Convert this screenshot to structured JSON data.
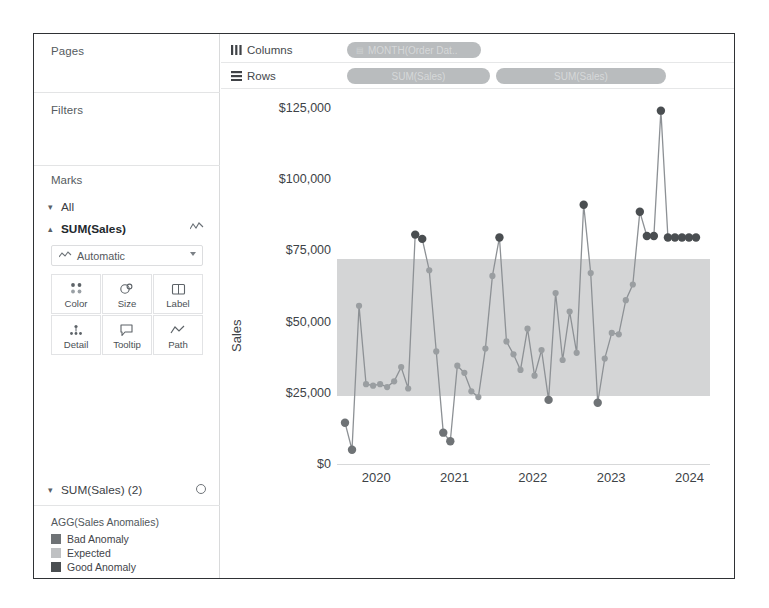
{
  "window": {
    "title": "Tableau Worksheet"
  },
  "sidebar": {
    "pages": {
      "label": "Pages"
    },
    "filters": {
      "label": "Filters"
    },
    "marks": {
      "label": "Marks",
      "all_label": "All",
      "sum_sales_label": "SUM(Sales)",
      "mark_type": "Automatic",
      "buttons": [
        {
          "label": "Color",
          "icon": "color-icon"
        },
        {
          "label": "Size",
          "icon": "size-icon"
        },
        {
          "label": "Label",
          "icon": "label-icon"
        },
        {
          "label": "Detail",
          "icon": "detail-icon"
        },
        {
          "label": "Tooltip",
          "icon": "tooltip-icon"
        },
        {
          "label": "Path",
          "icon": "path-icon"
        }
      ],
      "sum_sales_2_label": "SUM(Sales) (2)"
    },
    "legend": {
      "title": "AGG(Sales Anomalies)",
      "items": [
        {
          "label": "Bad Anomaly",
          "color": "#6f7376"
        },
        {
          "label": "Expected",
          "color": "#bfc1c3"
        },
        {
          "label": "Good Anomaly",
          "color": "#4a4e51"
        }
      ]
    }
  },
  "shelves": {
    "columns_label": "Columns",
    "rows_label": "Rows",
    "columns_pills": [
      {
        "text": "MONTH(Order Dat.."
      }
    ],
    "rows_pills": [
      {
        "text": "SUM(Sales)"
      },
      {
        "text": "SUM(Sales)"
      }
    ]
  },
  "chart_data": {
    "type": "line",
    "title": "",
    "xlabel": "",
    "ylabel": "Sales",
    "ylim": [
      0,
      131250
    ],
    "yticks": [
      0,
      25000,
      50000,
      75000,
      100000,
      125000
    ],
    "ytick_labels": [
      "$0",
      "$25,000",
      "$50,000",
      "$75,000",
      "$100,000",
      "$125,000"
    ],
    "xticks": [
      "2020",
      "2021",
      "2022",
      "2023",
      "2024"
    ],
    "xtick_positions": [
      0.105,
      0.315,
      0.525,
      0.735,
      0.945
    ],
    "grid": false,
    "legend_position": "sidebar",
    "band": {
      "label": "Expected",
      "upper": 72000,
      "lower": 24000,
      "color": "#d4d5d6"
    },
    "marker_colors": {
      "bad": "#6f7376",
      "expected": "#9a9ea1",
      "good": "#4a4e51"
    },
    "line_color": "#8d9195",
    "series": [
      {
        "name": "SUM(Sales)",
        "x": [
          "2020-01",
          "2020-02",
          "2020-03",
          "2020-04",
          "2020-05",
          "2020-06",
          "2020-07",
          "2020-08",
          "2020-09",
          "2020-10",
          "2020-11",
          "2020-12",
          "2021-01",
          "2021-02",
          "2021-03",
          "2021-04",
          "2021-05",
          "2021-06",
          "2021-07",
          "2021-08",
          "2021-09",
          "2021-10",
          "2021-11",
          "2021-12",
          "2022-01",
          "2022-02",
          "2022-03",
          "2022-04",
          "2022-05",
          "2022-06",
          "2022-07",
          "2022-08",
          "2022-09",
          "2022-10",
          "2022-11",
          "2022-12",
          "2023-01",
          "2023-02",
          "2023-03",
          "2023-04",
          "2023-05",
          "2023-06",
          "2023-07",
          "2023-08",
          "2023-09",
          "2023-10",
          "2023-11",
          "2023-12",
          "2024-01",
          "2024-02",
          "2024-03"
        ],
        "values": [
          14500,
          5000,
          55500,
          28000,
          27500,
          28000,
          27000,
          29000,
          34000,
          26500,
          80500,
          79000,
          68000,
          39500,
          11000,
          8000,
          34500,
          32000,
          25500,
          23500,
          40500,
          66000,
          79500,
          43000,
          38500,
          33000,
          47500,
          31000,
          40000,
          22500,
          60000,
          36500,
          53500,
          39000,
          91000,
          67000,
          21500,
          37000,
          46000,
          45500,
          57500,
          63000,
          88500,
          80000,
          80000,
          124000,
          79500,
          79500,
          79500,
          79500,
          79500
        ],
        "anomaly_flags": [
          "bad",
          "bad",
          "expected",
          "expected",
          "expected",
          "expected",
          "expected",
          "expected",
          "expected",
          "expected",
          "good",
          "good",
          "expected",
          "expected",
          "bad",
          "bad",
          "expected",
          "expected",
          "expected",
          "expected",
          "expected",
          "expected",
          "good",
          "expected",
          "expected",
          "expected",
          "expected",
          "expected",
          "expected",
          "bad",
          "expected",
          "expected",
          "expected",
          "expected",
          "good",
          "expected",
          "bad",
          "expected",
          "expected",
          "expected",
          "expected",
          "expected",
          "good",
          "good",
          "good",
          "good",
          "good",
          "good",
          "good",
          "good",
          "good"
        ]
      }
    ]
  }
}
